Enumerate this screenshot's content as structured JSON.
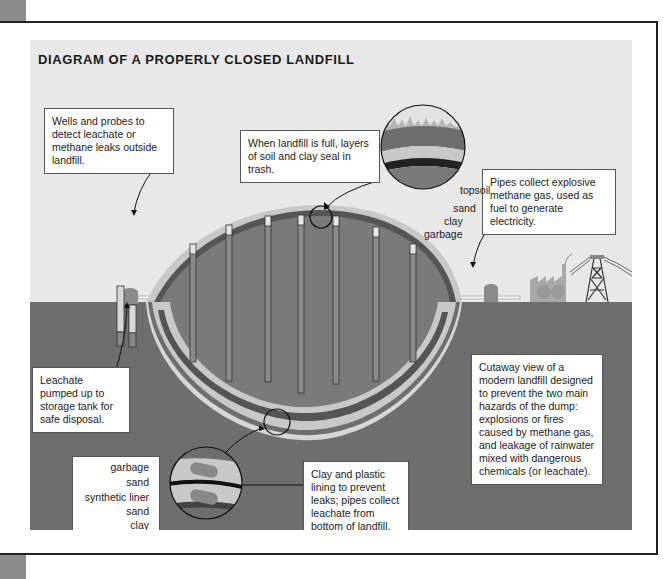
{
  "title": "DIAGRAM OF A PROPERLY CLOSED LANDFILL",
  "callouts": {
    "full": "When landfill is full, layers of soil and clay seal in trash.",
    "wells": "Wells and probes to detect leachate or methane leaks outside landfill.",
    "pipes": "Pipes collect explosive methane gas, used as fuel to generate electricity.",
    "leachate": "Leachate pumped up to storage tank for safe disposal.",
    "cutaway": "Cutaway view of a modern landfill designed to prevent the two main hazards of the dump: explosions or fires caused by methane gas, and leakage of rainwater mixed with dangerous chemicals (or leachate).",
    "lining": "Clay and plastic lining to prevent leaks; pipes collect leachate from bottom of landfill."
  },
  "top_layers": {
    "labels": [
      "topsoil",
      "sand",
      "clay",
      "garbage"
    ]
  },
  "bottom_layers": {
    "labels": [
      "garbage",
      "sand",
      "synthetic liner",
      "sand",
      "clay",
      "subsoil"
    ]
  },
  "colors": {
    "background_sky": "#e8e8e8",
    "ground": "#6e6e6e",
    "garbage": "#7a7a7a",
    "sand": "#c8c8c8",
    "clay": "#555555",
    "liner": "#1a1a1a",
    "frame_tab": "#8c8c8c"
  }
}
